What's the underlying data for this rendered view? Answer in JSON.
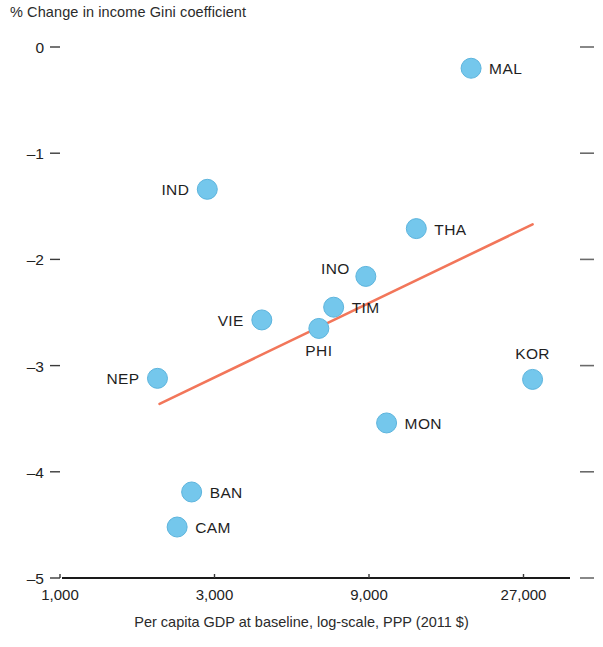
{
  "chart_data": {
    "type": "scatter",
    "title": "% Change in income Gini coefficient",
    "xlabel": "Per capita GDP at baseline, log-scale, PPP (2011 $)",
    "ylabel": "% Change in income Gini coefficient",
    "xscale": "log",
    "xlim": [
      1000,
      40000
    ],
    "ylim": [
      -5,
      0
    ],
    "grid": false,
    "legend": "none",
    "xticks": [
      {
        "value": 1000,
        "label": "1,000"
      },
      {
        "value": 3000,
        "label": "3,000"
      },
      {
        "value": 9000,
        "label": "9,000"
      },
      {
        "value": 27000,
        "label": "27,000"
      }
    ],
    "yticks": [
      {
        "value": 0,
        "label": "0"
      },
      {
        "value": -1,
        "label": "–1"
      },
      {
        "value": -2,
        "label": "–2"
      },
      {
        "value": -3,
        "label": "–3"
      },
      {
        "value": -4,
        "label": "–4"
      },
      {
        "value": -5,
        "label": "–5"
      }
    ],
    "points": [
      {
        "name": "MAL",
        "x": 18600,
        "y": -0.2,
        "label_pos": "right"
      },
      {
        "name": "IND",
        "x": 2850,
        "y": -1.34,
        "label_pos": "left"
      },
      {
        "name": "THA",
        "x": 12600,
        "y": -1.71,
        "label_pos": "right"
      },
      {
        "name": "INO",
        "x": 8800,
        "y": -2.16,
        "label_pos": "upleft"
      },
      {
        "name": "TIM",
        "x": 7000,
        "y": -2.45,
        "label_pos": "right"
      },
      {
        "name": "VIE",
        "x": 4200,
        "y": -2.57,
        "label_pos": "left"
      },
      {
        "name": "PHI",
        "x": 6300,
        "y": -2.65,
        "label_pos": "below"
      },
      {
        "name": "NEP",
        "x": 2000,
        "y": -3.12,
        "label_pos": "left"
      },
      {
        "name": "KOR",
        "x": 28800,
        "y": -3.13,
        "label_pos": "above"
      },
      {
        "name": "MON",
        "x": 10200,
        "y": -3.54,
        "label_pos": "right"
      },
      {
        "name": "BAN",
        "x": 2550,
        "y": -4.19,
        "label_pos": "right"
      },
      {
        "name": "CAM",
        "x": 2300,
        "y": -4.52,
        "label_pos": "right"
      }
    ],
    "trendline": {
      "x_start": 2030,
      "y_start": -3.36,
      "x_end": 28800,
      "y_end": -1.67,
      "color": "#f2765a"
    },
    "marker_color": "#74c7ec",
    "marker_radius": 10
  }
}
